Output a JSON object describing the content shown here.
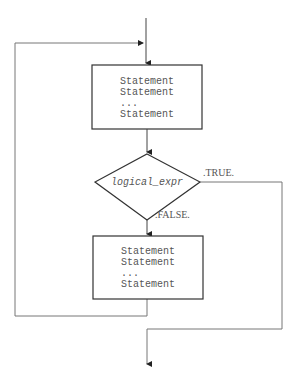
{
  "diagram": {
    "type": "flowchart",
    "title": "",
    "colors": {
      "stroke": "#333333",
      "line": "#777777",
      "text": "#555555",
      "background": "#ffffff"
    },
    "nodes": [
      {
        "id": "block1",
        "shape": "rectangle",
        "lines": [
          "Statement",
          "Statement",
          "...",
          "Statement"
        ]
      },
      {
        "id": "decision",
        "shape": "diamond",
        "label": "logical_expr"
      },
      {
        "id": "block2",
        "shape": "rectangle",
        "lines": [
          "Statement",
          "Statement",
          "...",
          "Statement"
        ]
      }
    ],
    "edges": [
      {
        "from": "entry",
        "to": "block1",
        "label": ""
      },
      {
        "from": "block1",
        "to": "decision",
        "label": ""
      },
      {
        "from": "decision",
        "to": "exit",
        "label": ".TRUE."
      },
      {
        "from": "decision",
        "to": "block2",
        "label": ".FALSE."
      },
      {
        "from": "block2",
        "to": "block1",
        "label": ""
      }
    ]
  }
}
